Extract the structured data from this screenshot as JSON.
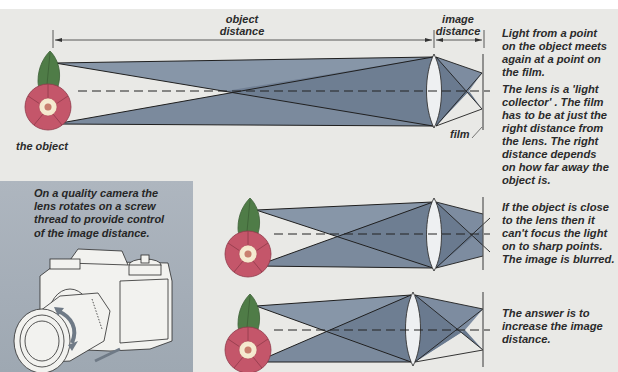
{
  "diagram": {
    "labels": {
      "object_distance": [
        "object",
        "distance"
      ],
      "image_distance": [
        "image",
        "distance"
      ],
      "the_object": "the object",
      "film": "film"
    },
    "captions": {
      "light_point": [
        "Light from a point",
        "on the object meets",
        "again at a point on",
        "the film."
      ],
      "light_collector": [
        "The lens is a 'light",
        "collector' . The film",
        "has to be at just the",
        "right distance from",
        "the lens. The right",
        "distance depends",
        "on how far away the",
        "object is."
      ],
      "close_object": [
        "If the object is close",
        "to the lens then it",
        "can't focus the light",
        "on to sharp points.",
        "The image is blurred."
      ],
      "answer": [
        "The answer is to",
        "increase the image",
        "distance."
      ],
      "camera": [
        "On a quality camera the",
        "lens rotates on a screw",
        "thread to provide control",
        "of the image distance."
      ]
    },
    "panels": [
      {
        "name": "far-object",
        "object_x": 52,
        "lens_x": 435,
        "film_x": 483,
        "focus": "on-film"
      },
      {
        "name": "close-object",
        "object_x": 250,
        "lens_x": 435,
        "film_x": 483,
        "focus": "behind-film"
      },
      {
        "name": "increased-image-distance",
        "object_x": 250,
        "lens_x": 413,
        "film_x": 483,
        "focus": "on-film"
      }
    ],
    "colors": {
      "background": "#e9e9e6",
      "beam_dark": "#6f7f93",
      "beam_light": "#9aa7b6",
      "lens": "#eef0f2",
      "flower": "#c2566a",
      "flower_center": "#f4e7c8",
      "leaf": "#4d7a45",
      "camera_panel": "#a7b0ba",
      "text": "#2b2b2b"
    }
  }
}
